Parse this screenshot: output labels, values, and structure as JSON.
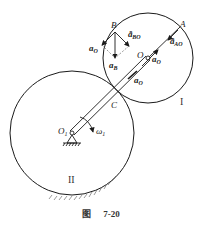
{
  "figure": {
    "caption_prefix": "图",
    "caption_number": "7-20"
  },
  "points": {
    "A": "A",
    "B": "B",
    "C": "C",
    "O": "O",
    "O1_main": "O",
    "O1_sub": "1"
  },
  "gears": {
    "gear1_label": "I",
    "gear2_label": "II"
  },
  "angular_velocity": {
    "symbol": "ω",
    "sub": "1"
  },
  "vectors": {
    "aO_left": {
      "main": "a",
      "sub": "O"
    },
    "aBO_n": {
      "main": "a",
      "sup": "n",
      "sub": "BO"
    },
    "aB": {
      "main": "a",
      "sub": "B"
    },
    "aO_right": {
      "main": "a",
      "sub": "O"
    },
    "aAO_n": {
      "main": "a",
      "sup": "n",
      "sub": "AO"
    },
    "aO_lower": {
      "main": "a",
      "sub": "O"
    }
  },
  "colors": {
    "stroke": "#1a1a1a",
    "dashed": "#555555",
    "background": "#ffffff"
  }
}
